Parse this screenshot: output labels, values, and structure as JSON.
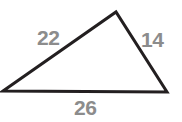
{
  "figure": {
    "kind": "geometry-diagram",
    "shape": "triangle",
    "background_color": "#ffffff",
    "stroke_color": "#231f20",
    "stroke_width": 3,
    "label_color": "#8c8c8c",
    "vertices": {
      "left": {
        "x": 3,
        "y": 91
      },
      "apex": {
        "x": 116,
        "y": 12
      },
      "right": {
        "x": 167,
        "y": 92
      }
    },
    "labels": {
      "left_side": "22",
      "right_side": "14",
      "bottom_side": "26"
    }
  },
  "chart_data": {
    "type": "diagram",
    "title": "",
    "shape": "triangle",
    "sides": [
      {
        "name": "left",
        "label": "22",
        "value": 22,
        "from": "left",
        "to": "apex"
      },
      {
        "name": "right",
        "label": "14",
        "value": 14,
        "from": "apex",
        "to": "right"
      },
      {
        "name": "bottom",
        "label": "26",
        "value": 26,
        "from": "left",
        "to": "right"
      }
    ],
    "labels": [
      "22",
      "14",
      "26"
    ],
    "values": [
      22,
      14,
      26
    ]
  }
}
